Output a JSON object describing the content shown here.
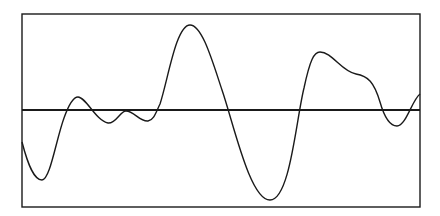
{
  "figure": {
    "frame": {
      "x": 22,
      "y": 14,
      "width": 398,
      "height": 193
    },
    "baseline_y": 110,
    "stroke_color": "#1a1a1a",
    "waveform_path": "M22,142 C28,165 34,180 42,180 C50,180 56,140 64,118 C69,104 73,97 78,97 C86,97 96,121 108,123 C116,124 120,111 126,111 C134,111 140,122 148,121 C154,120 156,112 160,104 C168,80 176,25 190,25 C202,25 212,60 222,90 C234,125 250,200 270,200 C290,200 296,120 304,88 C310,60 314,52 320,52 C332,52 342,72 356,74 C368,76 374,82 380,102 C384,116 390,126 397,126 C406,126 412,100 420,94"
  }
}
